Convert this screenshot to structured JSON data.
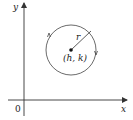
{
  "diagram": {
    "axes": {
      "x_label": "x",
      "y_label": "y",
      "origin_label": "0"
    },
    "circle": {
      "center_label": "(h, k)",
      "radius_label": "r"
    },
    "colors": {
      "stroke": "#333333",
      "background": "#ffffff"
    }
  }
}
